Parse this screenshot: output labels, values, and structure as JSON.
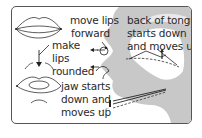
{
  "diagram": {
    "title": "",
    "labels": {
      "move_lips_line1": "move lips",
      "move_lips_line2": "forward",
      "make_line1": "make",
      "make_line2": "lips",
      "make_line3": "rounded",
      "tongue_line1": "back of tongue",
      "tongue_line2": "starts down",
      "tongue_line3": "and moves up",
      "jaw_line1": "jaw starts",
      "jaw_line2": "down and",
      "jaw_line3": "moves up"
    },
    "colors": {
      "silhouette": "#c8c8c8",
      "border": "#555555",
      "line": "#222222",
      "text": "#2a2a2a"
    }
  }
}
